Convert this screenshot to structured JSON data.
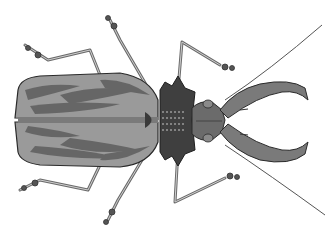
{
  "image": {
    "subject": "Beetle illustration (top-down view)",
    "description": "Grayscale drawing of a longhorn beetle with long mandibles and antennae, striped elytra, spiked pronotum, six legs",
    "colors": {
      "background": "#ffffff",
      "elytra_base": "#9a9a9a",
      "elytra_stripes": "#5e5e5e",
      "pronotum": "#3f3f3f",
      "head": "#6b6b6b",
      "legs": "#8a8a8a",
      "outline": "#2a2a2a"
    }
  }
}
